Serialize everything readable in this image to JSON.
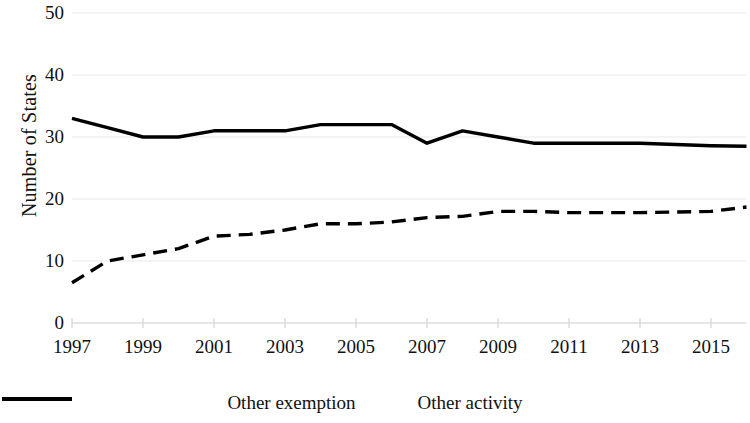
{
  "chart_data": {
    "type": "line",
    "title": "",
    "xlabel": "",
    "ylabel": "Number of States",
    "xlim": [
      1997,
      2016
    ],
    "ylim": [
      0,
      50
    ],
    "grid": true,
    "legend_position": "bottom",
    "x": [
      1997,
      1998,
      1999,
      2000,
      2001,
      2002,
      2003,
      2004,
      2005,
      2006,
      2007,
      2008,
      2009,
      2010,
      2011,
      2012,
      2013,
      2014,
      2015,
      2016
    ],
    "xtick_labels": [
      "1997",
      "1999",
      "2001",
      "2003",
      "2005",
      "2007",
      "2009",
      "2011",
      "2013",
      "2015"
    ],
    "xticks": [
      1997,
      1999,
      2001,
      2003,
      2005,
      2007,
      2009,
      2011,
      2013,
      2015
    ],
    "ytick_labels": [
      "0",
      "10",
      "20",
      "30",
      "40",
      "50"
    ],
    "yticks": [
      0,
      10,
      20,
      30,
      40,
      50
    ],
    "series": [
      {
        "name": "Other exemption",
        "style": "solid",
        "color": "#000000",
        "values": [
          33,
          31.5,
          30,
          30,
          31,
          31,
          31,
          32,
          32,
          32,
          29,
          31,
          30,
          29,
          29,
          29,
          29,
          28.8,
          28.6,
          28.5
        ]
      },
      {
        "name": "Other activity",
        "style": "dashed",
        "color": "#000000",
        "values": [
          6.5,
          10,
          11,
          12,
          14,
          14.3,
          15,
          16,
          16,
          16.3,
          17,
          17.2,
          18,
          18,
          17.8,
          17.8,
          17.8,
          17.9,
          18,
          18.7
        ]
      }
    ]
  },
  "legend": {
    "items": [
      {
        "label": "Other exemption",
        "style": "solid"
      },
      {
        "label": "Other activity",
        "style": "dashed"
      }
    ]
  },
  "axes": {
    "y_title": "Number of States"
  }
}
